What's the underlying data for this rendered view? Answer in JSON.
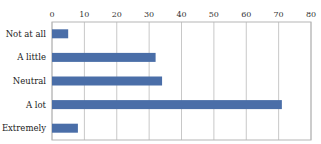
{
  "chart_data": {
    "type": "bar",
    "orientation": "horizontal",
    "title": "",
    "xlabel": "",
    "ylabel": "",
    "categories": [
      "Not at all",
      "A little",
      "Neutral",
      "A lot",
      "Extremely"
    ],
    "values": [
      5,
      32,
      34,
      71,
      8
    ],
    "xlim": [
      0,
      80
    ],
    "xticks": [
      0,
      10,
      20,
      30,
      40,
      50,
      60,
      70,
      80
    ],
    "xtick_labels": [
      "0",
      "10",
      "20",
      "30",
      "40",
      "50",
      "60",
      "70",
      "80"
    ],
    "x_axis_position": "top",
    "grid": true,
    "legend": "none",
    "bar_color": "#4a6ea8"
  }
}
